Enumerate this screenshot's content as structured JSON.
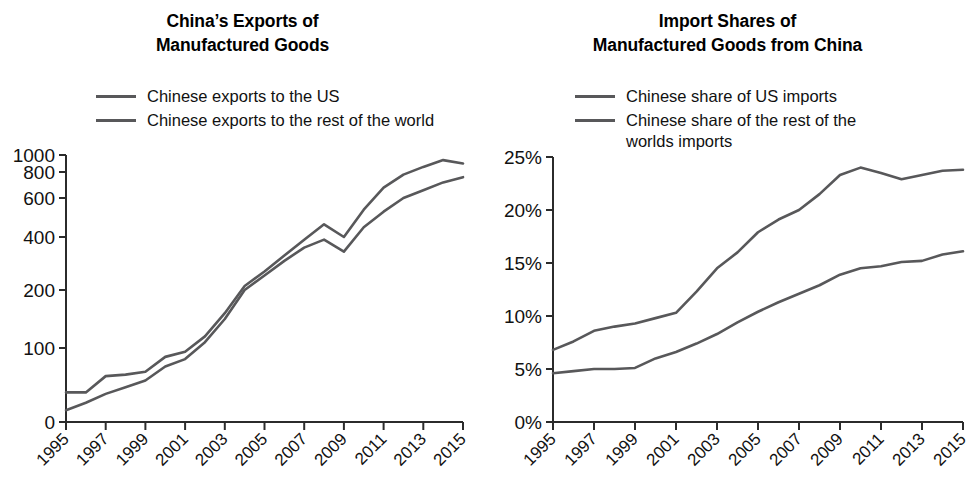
{
  "figure": {
    "background": "#ffffff",
    "line_color": "#58585a",
    "axis_color": "#2b2b2b"
  },
  "panels": [
    {
      "id": "exports",
      "title_line1": "China’s Exports of",
      "title_line2": "Manufactured Goods",
      "legend": [
        {
          "label": "Chinese exports to the US",
          "color": "#58585a"
        },
        {
          "label": "Chinese exports to the rest of the world",
          "color": "#58585a"
        }
      ],
      "y_ticks": [
        "0",
        "100",
        "200",
        "400",
        "600",
        "800",
        "1000"
      ],
      "x_ticks": [
        "1995",
        "1997",
        "1999",
        "2001",
        "2003",
        "2005",
        "2007",
        "2009",
        "2011",
        "2013",
        "2015"
      ]
    },
    {
      "id": "import-shares",
      "title_line1": "Import Shares of",
      "title_line2": "Manufactured Goods from China",
      "legend": [
        {
          "label": "Chinese share of US imports",
          "color": "#58585a"
        },
        {
          "label": "Chinese share of the rest of the\nworlds imports",
          "color": "#58585a"
        }
      ],
      "y_ticks": [
        "0%",
        "5%",
        "10%",
        "15%",
        "20%",
        "25%"
      ],
      "x_ticks": [
        "1995",
        "1997",
        "1999",
        "2001",
        "2003",
        "2005",
        "2007",
        "2009",
        "2011",
        "2013",
        "2015"
      ]
    }
  ],
  "chart_data": [
    {
      "type": "line",
      "title": "China’s Exports of Manufactured Goods",
      "xlabel": "",
      "ylabel": "",
      "xlim": [
        1995,
        2015
      ],
      "ylim": [
        0,
        1000
      ],
      "yscale": "nonlinear-compressed",
      "grid": false,
      "legend_position": "above-plot",
      "x": [
        1995,
        1996,
        1997,
        1998,
        1999,
        2000,
        2001,
        2002,
        2003,
        2004,
        2005,
        2006,
        2007,
        2008,
        2009,
        2010,
        2011,
        2012,
        2013,
        2014,
        2015
      ],
      "series": [
        {
          "name": "Chinese exports to the US",
          "color": "#58585a",
          "values": [
            16,
            26,
            38,
            47,
            56,
            75,
            85,
            110,
            150,
            200,
            255,
            310,
            360,
            390,
            345,
            450,
            530,
            600,
            660,
            720,
            760
          ]
        },
        {
          "name": "Chinese exports to the rest of the world",
          "color": "#58585a",
          "values": [
            40,
            40,
            62,
            64,
            68,
            88,
            95,
            120,
            160,
            215,
            270,
            330,
            390,
            465,
            400,
            540,
            680,
            780,
            860,
            940,
            900
          ]
        }
      ]
    },
    {
      "type": "line",
      "title": "Import Shares of Manufactured Goods from China",
      "xlabel": "",
      "ylabel": "",
      "xlim": [
        1995,
        2015
      ],
      "ylim": [
        0,
        25
      ],
      "yunit": "%",
      "yscale": "linear",
      "grid": false,
      "legend_position": "above-plot",
      "x": [
        1995,
        1996,
        1997,
        1998,
        1999,
        2000,
        2001,
        2002,
        2003,
        2004,
        2005,
        2006,
        2007,
        2008,
        2009,
        2010,
        2011,
        2012,
        2013,
        2014,
        2015
      ],
      "series": [
        {
          "name": "Chinese share of US imports",
          "color": "#58585a",
          "values": [
            6.8,
            7.6,
            8.6,
            9.0,
            9.3,
            9.8,
            10.3,
            12.3,
            14.5,
            16.0,
            17.9,
            19.1,
            20.0,
            21.5,
            23.3,
            24.0,
            23.5,
            22.9,
            23.3,
            23.7,
            23.8
          ]
        },
        {
          "name": "Chinese share of the rest of the worlds imports",
          "color": "#58585a",
          "values": [
            4.6,
            4.8,
            5.0,
            5.0,
            5.1,
            6.0,
            6.6,
            7.4,
            8.3,
            9.4,
            10.4,
            11.3,
            12.1,
            12.9,
            13.9,
            14.5,
            14.7,
            15.1,
            15.2,
            15.8,
            16.1
          ]
        }
      ]
    }
  ]
}
